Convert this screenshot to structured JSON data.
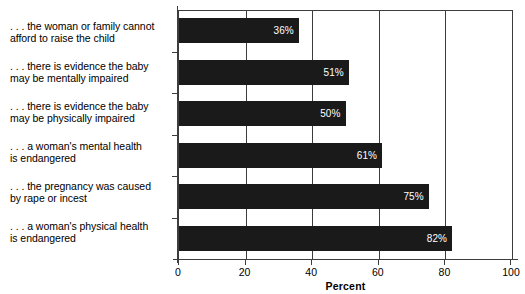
{
  "chart_data": {
    "type": "bar",
    "orientation": "horizontal",
    "title": "",
    "xlabel": "Percent",
    "ylabel": "",
    "xlim": [
      0,
      100
    ],
    "xticks": [
      0,
      20,
      40,
      60,
      80,
      100
    ],
    "xticklabels": [
      "0",
      "20",
      "40",
      "60",
      "80",
      "100"
    ],
    "grid": true,
    "grid_axis": "x",
    "legend": false,
    "bar_color": "#1a1a1a",
    "value_label_color": "#ffffff",
    "categories": [
      ". . . the woman or family cannot afford to raise the child",
      ". . . there is evidence the baby may be mentally impaired",
      ". . . there is evidence the baby may be physically impaired",
      ". . . a woman's mental health is endangered",
      ". . . the pregnancy was caused by rape or incest",
      ". . . a woman's physical health is endangered"
    ],
    "category_lines": [
      [
        ". . . the woman or family cannot",
        "afford to raise the child"
      ],
      [
        ". . . there is evidence the baby",
        "may be mentally impaired"
      ],
      [
        ". . . there is evidence the baby",
        "may be physically impaired"
      ],
      [
        ". . . a woman's mental health",
        "is endangered"
      ],
      [
        ". . . the pregnancy was caused",
        "by rape or incest"
      ],
      [
        ". . . a woman's physical health",
        "is endangered"
      ]
    ],
    "values": [
      36,
      51,
      50,
      61,
      75,
      82
    ],
    "value_labels": [
      "36%",
      "51%",
      "50%",
      "61%",
      "75%",
      "82%"
    ]
  }
}
